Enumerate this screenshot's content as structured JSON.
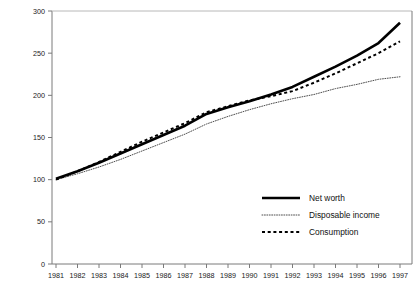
{
  "chart_data": {
    "type": "line",
    "title": "",
    "subtitle": "",
    "xlabel": "",
    "ylabel": "",
    "xlim": [
      1980.5,
      1997.5
    ],
    "ylim": [
      0,
      300
    ],
    "grid": false,
    "legend_position": "bottom-right",
    "x": [
      1981,
      1982,
      1983,
      1984,
      1985,
      1986,
      1987,
      1988,
      1989,
      1990,
      1991,
      1992,
      1993,
      1994,
      1995,
      1996,
      1997
    ],
    "categories": [
      "1981",
      "1982",
      "1983",
      "1984",
      "1985",
      "1986",
      "1987",
      "1988",
      "1989",
      "1990",
      "1991",
      "1992",
      "1993",
      "1994",
      "1995",
      "1996",
      "1997"
    ],
    "xticks": [
      "1981",
      "1982",
      "1983",
      "1984",
      "1985",
      "1986",
      "1987",
      "1988",
      "1989",
      "1990",
      "1991",
      "1992",
      "1993",
      "1994",
      "1995",
      "1996",
      "1997"
    ],
    "yticks": [
      "0",
      "50",
      "100",
      "150",
      "200",
      "250",
      "300"
    ],
    "ytick_values": [
      0,
      50,
      100,
      150,
      200,
      250,
      300
    ],
    "series": [
      {
        "name": "Net worth",
        "style": "solid",
        "color": "#000000",
        "width": 2.6,
        "values": [
          101,
          110,
          120,
          131,
          142,
          153,
          164,
          178,
          186,
          193,
          201,
          210,
          222,
          234,
          247,
          262,
          286
        ]
      },
      {
        "name": "Disposable income",
        "style": "dotted",
        "color": "#3a3a3a",
        "width": 0.9,
        "values": [
          100,
          107,
          115,
          124,
          134,
          144,
          154,
          166,
          175,
          183,
          190,
          196,
          201,
          208,
          213,
          219,
          222
        ]
      },
      {
        "name": "Consumption",
        "style": "dashed",
        "color": "#000000",
        "width": 2.0,
        "values": [
          100,
          110,
          121,
          133,
          145,
          156,
          167,
          180,
          187,
          194,
          199,
          205,
          215,
          226,
          238,
          250,
          264
        ]
      }
    ]
  },
  "legend": {
    "entries": [
      {
        "label": "Net worth",
        "swatch": "solid-line-swatch"
      },
      {
        "label": "Disposable income",
        "swatch": "dotted-line-swatch"
      },
      {
        "label": "Consumption",
        "swatch": "dashed-line-swatch"
      }
    ]
  },
  "axes": {
    "y_axis_name": "value-axis",
    "x_axis_name": "year-axis"
  }
}
